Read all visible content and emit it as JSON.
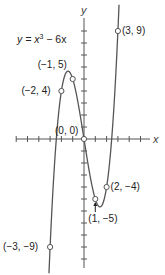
{
  "chart_data": {
    "type": "line",
    "title": "",
    "equation": "y = x^3 - 6x",
    "equation_parts": {
      "lhs": "y = x",
      "exp": "3",
      "rhs": " − 6x"
    },
    "xlabel": "x",
    "ylabel": "y",
    "xlim": [
      -6,
      6
    ],
    "ylim": [
      -11,
      10
    ],
    "grid": false,
    "legend": "none",
    "x_tick_step": 1,
    "y_tick_step": 1,
    "series": [
      {
        "name": "y = x^3 - 6x",
        "function": "x^3 - 6x",
        "domain": [
          -3.1,
          3.1
        ]
      }
    ],
    "points": [
      {
        "x": -3,
        "y": -9,
        "label": "(−3, −9)"
      },
      {
        "x": -2,
        "y": 4,
        "label": "(−2, 4)"
      },
      {
        "x": -1,
        "y": 5,
        "label": "(−1, 5)"
      },
      {
        "x": 0,
        "y": 0,
        "label": "(0, 0)"
      },
      {
        "x": 1,
        "y": -5,
        "label": "(1, −5)"
      },
      {
        "x": 2,
        "y": -4,
        "label": "(2, −4)"
      },
      {
        "x": 3,
        "y": 9,
        "label": "(3, 9)"
      }
    ]
  },
  "colors": {
    "curve": "#555555",
    "axis": "#555555",
    "point_fill": "#ffffff",
    "text": "#222222"
  }
}
